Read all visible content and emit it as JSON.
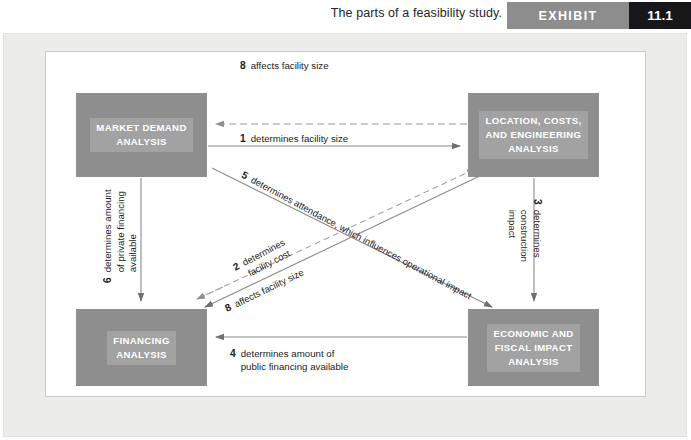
{
  "header": {
    "caption": "The parts of a feasibility study.",
    "exhibit_label": "EXHIBIT",
    "exhibit_number": "11.1"
  },
  "colors": {
    "node_fill": "#8e8e8e",
    "node_label_fill": "#a2a2a2",
    "node_text": "#ffffff",
    "frame_fill": "#ececeb",
    "panel_fill": "#ffffff",
    "badge_gray": "#8d8d8d",
    "badge_black": "#17161a",
    "connector": "#8a8a8a",
    "label_text": "#1c1c1c"
  },
  "diagram": {
    "type": "flow-relationship-diagram",
    "nodes": [
      {
        "id": "market",
        "label": "MARKET DEMAND\nANALYSIS"
      },
      {
        "id": "location",
        "label": "LOCATION, COSTS,\nAND ENGINEERING\nANALYSIS"
      },
      {
        "id": "financing",
        "label": "FINANCING\nANALYSIS"
      },
      {
        "id": "economic",
        "label": "ECONOMIC AND\nFISCAL IMPACT\nANALYSIS"
      }
    ],
    "edges": [
      {
        "number": "1",
        "text": "determines facility size",
        "from": "market",
        "to": "location",
        "style": "solid",
        "direction": "right"
      },
      {
        "number": "2",
        "text": "determines\nfacility cost",
        "from": "location",
        "to": "financing",
        "style": "solid",
        "direction": "down-left"
      },
      {
        "number": "3",
        "text": "determines\nconstruction\nimpact",
        "from": "location",
        "to": "economic",
        "style": "solid",
        "direction": "down"
      },
      {
        "number": "4",
        "text": "determines amount of\npublic financing available",
        "from": "economic",
        "to": "financing",
        "style": "solid",
        "direction": "left"
      },
      {
        "number": "5",
        "text": "determines attendance, which influences operational impact",
        "from": "market",
        "to": "economic",
        "style": "solid",
        "direction": "down-right"
      },
      {
        "number": "6",
        "text": "determines amount\nof private financing\navailable",
        "from": "market",
        "to": "financing",
        "style": "solid",
        "direction": "down"
      },
      {
        "number": "7",
        "text": "affects demand through number\nof seats, suites, and so on",
        "from": "location",
        "to": "market",
        "style": "dashed",
        "direction": "left"
      },
      {
        "number": "8",
        "text": "affects facility size",
        "from": "financing",
        "to": "location",
        "style": "dashed",
        "direction": "up-right"
      }
    ]
  }
}
